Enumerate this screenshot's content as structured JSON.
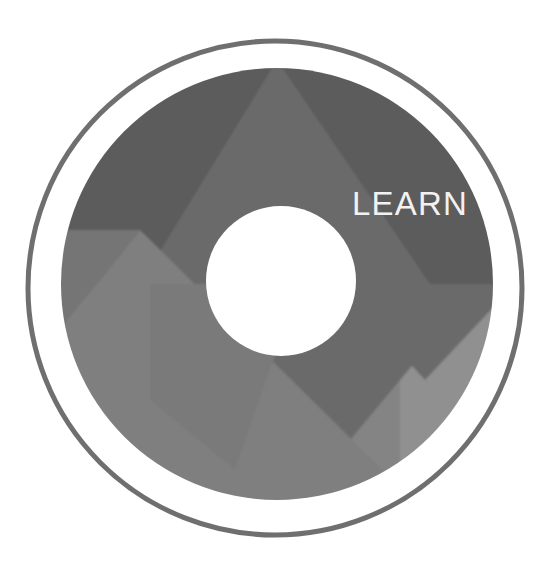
{
  "graphic": {
    "kind": "circular-emblem-logo",
    "label": "LEARN",
    "label_color": "#f2f2f2",
    "background_color": "#ffffff",
    "outer_ring": {
      "name": "outer-ring",
      "stroke_color": "#6f6f6f",
      "stroke_width": 5,
      "center_x": 275,
      "center_y": 288,
      "radius": 247
    },
    "white_gap": {
      "name": "white-gap-ring",
      "color": "#ffffff",
      "inner_radius": 216,
      "outer_radius": 244
    },
    "main_disc": {
      "name": "main-disc",
      "center_x": 277,
      "center_y": 284,
      "radius": 216,
      "base_color": "#7c7c7c"
    },
    "center_hole": {
      "name": "center-hole",
      "color": "#ffffff",
      "center_x": 281,
      "center_y": 281,
      "radius": 75
    },
    "segments": [
      {
        "name": "segment-top-dark",
        "color": "#5b5b5b"
      },
      {
        "name": "segment-upper-right",
        "color": "#6a6a6a"
      },
      {
        "name": "segment-left-mid",
        "color": "#757575"
      },
      {
        "name": "segment-lower-left",
        "color": "#7f7f7f"
      },
      {
        "name": "segment-bottom",
        "color": "#848484"
      },
      {
        "name": "segment-right-light",
        "color": "#8b8b8b"
      },
      {
        "name": "segment-far-right-light",
        "color": "#909090"
      }
    ],
    "label_position": {
      "x": 410,
      "y": 215
    }
  }
}
